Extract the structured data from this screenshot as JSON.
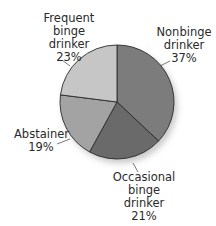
{
  "chart_data": {
    "type": "pie",
    "title": "",
    "start_angle_deg": 0,
    "direction": "clockwise",
    "slices": [
      {
        "label": "Nonbinge drinker",
        "label_lines": [
          "Nonbinge",
          "drinker"
        ],
        "value": 37,
        "display": "37%",
        "color": "#7c7c7c"
      },
      {
        "label": "Occasional binge drinker",
        "label_lines": [
          "Occasional",
          "binge",
          "drinker"
        ],
        "value": 21,
        "display": "21%",
        "color": "#6a6a6a"
      },
      {
        "label": "Abstainer",
        "label_lines": [
          "Abstainer"
        ],
        "value": 19,
        "display": "19%",
        "color": "#a3a3a3"
      },
      {
        "label": "Frequent binge drinker",
        "label_lines": [
          "Frequent",
          "binge",
          "drinker"
        ],
        "value": 23,
        "display": "23%",
        "color": "#c6c6c6"
      }
    ],
    "categories": [
      "Nonbinge drinker",
      "Occasional binge drinker",
      "Abstainer",
      "Frequent binge drinker"
    ],
    "values": [
      37,
      21,
      19,
      23
    ],
    "unit": "%",
    "legend": "none (direct labels with leader lines)"
  },
  "labels": {
    "nonbinge": {
      "line1": "Nonbinge",
      "line2": "drinker",
      "pct": "37%"
    },
    "occasional": {
      "line1": "Occasional",
      "line2": "binge",
      "line3": "drinker",
      "pct": "21%"
    },
    "abstainer": {
      "line1": "Abstainer",
      "pct": "19%"
    },
    "frequent": {
      "line1": "Frequent",
      "line2": "binge",
      "line3": "drinker",
      "pct": "23%"
    }
  },
  "style": {
    "outline_color": "#2b2b2b",
    "shadow_color": "#cfcfcf"
  }
}
